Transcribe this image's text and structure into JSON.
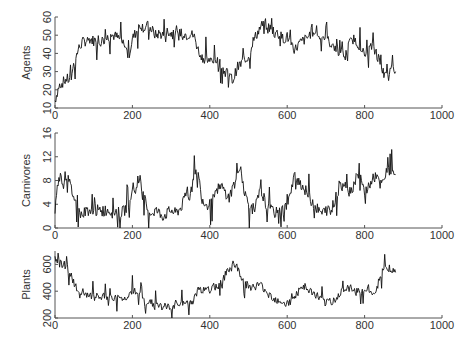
{
  "chart_data": [
    {
      "type": "line",
      "title": "",
      "xlabel": "",
      "ylabel": "Agents",
      "xlim": [
        0,
        1000
      ],
      "ylim": [
        10,
        60
      ],
      "xticks": [
        0,
        200,
        400,
        600,
        800,
        1000
      ],
      "yticks": [
        10,
        20,
        30,
        40,
        50,
        60
      ],
      "grid": false,
      "x": [
        0,
        10,
        20,
        30,
        40,
        50,
        60,
        70,
        80,
        90,
        100,
        110,
        120,
        130,
        140,
        150,
        160,
        170,
        180,
        190,
        200,
        210,
        220,
        230,
        240,
        250,
        260,
        270,
        280,
        290,
        300,
        310,
        320,
        330,
        340,
        350,
        360,
        370,
        380,
        390,
        400,
        410,
        420,
        430,
        440,
        450,
        460,
        470,
        480,
        490,
        500,
        510,
        520,
        530,
        540,
        550,
        560,
        570,
        580,
        590,
        600,
        610,
        620,
        630,
        640,
        650,
        660,
        670,
        680,
        690,
        700,
        710,
        720,
        730,
        740,
        750,
        760,
        770,
        780,
        790,
        800,
        810,
        820,
        830,
        840,
        850,
        860,
        870,
        880
      ],
      "series": [
        {
          "name": "Agents",
          "values": [
            14,
            22,
            24,
            26,
            25,
            35,
            42,
            46,
            47,
            48,
            47,
            48,
            47,
            48,
            49,
            50,
            49,
            47,
            45,
            38,
            48,
            52,
            56,
            54,
            55,
            53,
            50,
            51,
            50,
            52,
            51,
            50,
            49,
            52,
            50,
            51,
            49,
            42,
            38,
            37,
            36,
            35,
            37,
            33,
            30,
            28,
            25,
            32,
            34,
            37,
            38,
            46,
            50,
            54,
            57,
            55,
            53,
            52,
            50,
            48,
            49,
            46,
            42,
            45,
            47,
            48,
            51,
            53,
            49,
            50,
            48,
            46,
            44,
            42,
            40,
            38,
            45,
            48,
            46,
            44,
            38,
            42,
            44,
            40,
            36,
            28,
            26,
            32,
            30
          ]
        }
      ]
    },
    {
      "type": "line",
      "title": "",
      "xlabel": "",
      "ylabel": "Carnivores",
      "xlim": [
        0,
        1000
      ],
      "ylim": [
        0,
        16
      ],
      "xticks": [
        0,
        200,
        400,
        600,
        800,
        1000
      ],
      "yticks": [
        0,
        4,
        8,
        12,
        16
      ],
      "grid": false,
      "x": [
        0,
        10,
        20,
        30,
        40,
        50,
        60,
        70,
        80,
        90,
        100,
        110,
        120,
        130,
        140,
        150,
        160,
        170,
        180,
        190,
        200,
        210,
        220,
        230,
        240,
        250,
        260,
        270,
        280,
        290,
        300,
        310,
        320,
        330,
        340,
        350,
        360,
        370,
        380,
        390,
        400,
        410,
        420,
        430,
        440,
        450,
        460,
        470,
        480,
        490,
        500,
        510,
        520,
        530,
        540,
        550,
        560,
        570,
        580,
        590,
        600,
        610,
        620,
        630,
        640,
        650,
        660,
        670,
        680,
        690,
        700,
        710,
        720,
        730,
        740,
        750,
        760,
        770,
        780,
        790,
        800,
        810,
        820,
        830,
        840,
        850,
        860,
        870,
        880
      ],
      "series": [
        {
          "name": "Carnivores",
          "values": [
            3,
            9,
            8,
            9,
            7,
            5,
            3,
            2,
            3,
            3,
            2.5,
            3,
            2.5,
            3,
            3,
            2.5,
            3,
            2.5,
            3,
            4,
            7,
            6,
            8,
            5,
            3,
            2.5,
            3,
            2.5,
            2,
            2.5,
            3,
            2.5,
            3,
            4,
            6,
            5,
            10,
            9,
            5,
            4,
            4,
            5,
            6,
            7,
            6,
            5,
            7,
            8,
            10,
            6,
            4,
            3,
            4,
            6,
            5,
            3,
            3,
            2.5,
            3,
            3,
            4,
            6,
            9,
            8,
            7,
            6,
            5,
            4,
            3,
            2.5,
            3,
            3,
            4,
            6,
            7,
            8,
            6,
            7,
            9,
            8,
            6,
            7,
            8,
            9,
            7,
            8,
            10,
            9,
            9
          ]
        }
      ]
    },
    {
      "type": "line",
      "title": "",
      "xlabel": "",
      "ylabel": "Plants",
      "xlim": [
        0,
        1000
      ],
      "ylim": [
        200,
        700
      ],
      "xticks": [
        0,
        200,
        400,
        600,
        800,
        1000
      ],
      "yticks": [
        200,
        400,
        600
      ],
      "grid": false,
      "x": [
        0,
        10,
        20,
        30,
        40,
        50,
        60,
        70,
        80,
        90,
        100,
        110,
        120,
        130,
        140,
        150,
        160,
        170,
        180,
        190,
        200,
        210,
        220,
        230,
        240,
        250,
        260,
        270,
        280,
        290,
        300,
        310,
        320,
        330,
        340,
        350,
        360,
        370,
        380,
        390,
        400,
        410,
        420,
        430,
        440,
        450,
        460,
        470,
        480,
        490,
        500,
        510,
        520,
        530,
        540,
        550,
        560,
        570,
        580,
        590,
        600,
        610,
        620,
        630,
        640,
        650,
        660,
        670,
        680,
        690,
        700,
        710,
        720,
        730,
        740,
        750,
        760,
        770,
        780,
        790,
        800,
        810,
        820,
        830,
        840,
        850,
        860,
        870,
        880
      ],
      "series": [
        {
          "name": "Plants",
          "values": [
            660,
            610,
            600,
            590,
            520,
            460,
            380,
            370,
            365,
            360,
            360,
            355,
            355,
            360,
            355,
            350,
            345,
            345,
            340,
            380,
            400,
            390,
            370,
            330,
            320,
            310,
            300,
            290,
            285,
            280,
            285,
            290,
            295,
            300,
            310,
            320,
            340,
            420,
            410,
            400,
            410,
            430,
            440,
            470,
            520,
            560,
            600,
            580,
            520,
            460,
            440,
            430,
            440,
            450,
            420,
            390,
            360,
            340,
            330,
            320,
            310,
            320,
            360,
            400,
            420,
            410,
            400,
            380,
            360,
            330,
            310,
            320,
            330,
            370,
            400,
            410,
            420,
            420,
            410,
            400,
            400,
            420,
            380,
            400,
            520,
            560,
            580,
            560,
            540
          ]
        }
      ]
    }
  ],
  "panels": [
    {
      "ylabel": "Agents",
      "yticks": [
        "10",
        "20",
        "30",
        "40",
        "50",
        "60"
      ],
      "xticks": [
        "0",
        "200",
        "400",
        "600",
        "800",
        "1000"
      ]
    },
    {
      "ylabel": "Carnivores",
      "yticks": [
        "0",
        "4",
        "8",
        "12",
        "16"
      ],
      "xticks": [
        "0",
        "200",
        "400",
        "600",
        "800",
        "1000"
      ]
    },
    {
      "ylabel": "Plants",
      "yticks": [
        "200",
        "400",
        "600"
      ],
      "xticks": [
        "0",
        "200",
        "400",
        "600",
        "800",
        "1000"
      ]
    }
  ],
  "colors": {
    "line": "#111111",
    "axis": "#555555",
    "text": "#333333",
    "background": "#ffffff"
  }
}
